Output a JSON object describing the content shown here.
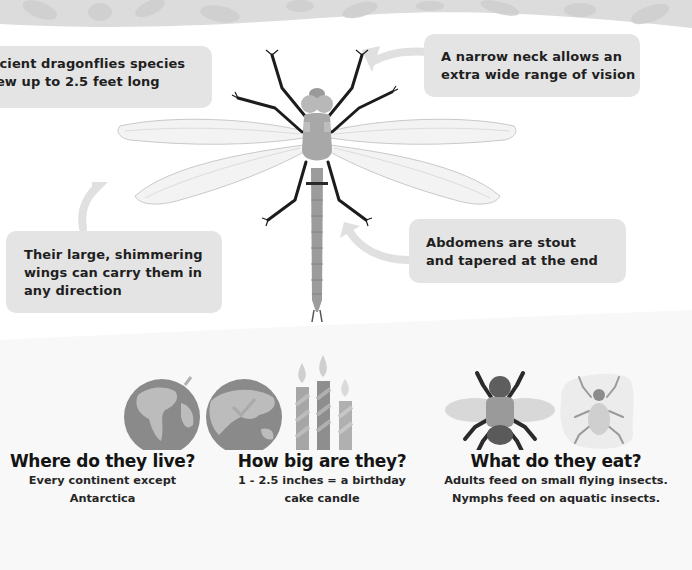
{
  "callouts": {
    "ancient": {
      "line1": "Ancient dragonflies species",
      "line2": "grew up to 2.5 feet long"
    },
    "neck": {
      "line1": "A narrow neck allows an",
      "line2": "extra wide range of vision"
    },
    "wings": {
      "line1": "Their large, shimmering",
      "line2": "wings can carry them in",
      "line3": "any direction"
    },
    "abdomen": {
      "line1": "Abdomens are stout",
      "line2": "and tapered at the end"
    }
  },
  "facts": {
    "live": {
      "icon": "globe-icon",
      "title": "Where do they live?",
      "line1": "Every continent except",
      "line2": "Antarctica"
    },
    "size": {
      "icon": "candles-icon",
      "title": "How big are they?",
      "line1": "1 - 2.5 inches = a birthday",
      "line2": "cake candle"
    },
    "eat": {
      "icon": "insects-icon",
      "title": "What do they eat?",
      "line1": "Adults feed on small flying insects.",
      "line2": "Nymphs feed on aquatic insects."
    }
  },
  "colors": {
    "callout_bg": "#e4e4e4",
    "banner": "#d9d9d9",
    "dragonfly_body": "#a8a8a8",
    "legs": "#1c1c1c"
  }
}
